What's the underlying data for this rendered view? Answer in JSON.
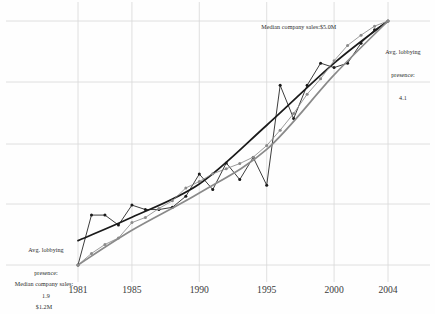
{
  "chart_data": {
    "type": "line",
    "title": "",
    "subtitle": "",
    "xlabel": "",
    "ylabel": "",
    "grid": true,
    "legend_position": "none",
    "xlim": [
      1981,
      2004
    ],
    "x_tick_labels": [
      "1981",
      "1985",
      "1990",
      "1995",
      "2000",
      "2004"
    ],
    "x_ticks": [
      1981,
      1985,
      1990,
      1995,
      2000,
      2004
    ],
    "y_axis_left": {
      "label": "Avg. lobbying presence",
      "start_value": 1.9,
      "end_value": 4.1
    },
    "y_axis_right": {
      "label": "Median company sales",
      "start_value": "$1.2M",
      "end_value": "$5.0M"
    },
    "series": [
      {
        "name": "Avg. lobbying presence",
        "color": "#1a1a1a",
        "marker": "circle",
        "x": [
          1981,
          1982,
          1983,
          1984,
          1985,
          1986,
          1987,
          1988,
          1989,
          1990,
          1991,
          1992,
          1993,
          1994,
          1995,
          1996,
          1997,
          1998,
          1999,
          2000,
          2001,
          2002,
          2003,
          2004
        ],
        "y": [
          1.9,
          2.35,
          2.35,
          2.26,
          2.44,
          2.4,
          2.4,
          2.42,
          2.52,
          2.72,
          2.58,
          2.82,
          2.67,
          2.87,
          2.62,
          3.52,
          3.22,
          3.52,
          3.72,
          3.68,
          3.72,
          3.9,
          4.02,
          4.1
        ]
      },
      {
        "name": "Avg. lobbying presence (trend)",
        "color": "#1a1a1a",
        "marker": "none",
        "trend": true,
        "x": [
          1981,
          1985,
          1990,
          1995,
          2000,
          2004
        ],
        "y": [
          2.12,
          2.33,
          2.63,
          3.16,
          3.72,
          4.1
        ]
      },
      {
        "name": "Median company sales",
        "color": "#8a8a8a",
        "marker": "circle",
        "x": [
          1981,
          1982,
          1983,
          1984,
          1985,
          1986,
          1987,
          1988,
          1989,
          1990,
          1991,
          1992,
          1993,
          1994,
          1995,
          1996,
          1997,
          1998,
          1999,
          2000,
          2001,
          2002,
          2003,
          2004
        ],
        "y": [
          1.2,
          1.38,
          1.52,
          1.62,
          1.86,
          1.94,
          2.08,
          2.2,
          2.4,
          2.5,
          2.62,
          2.7,
          2.78,
          2.88,
          3.06,
          3.3,
          3.56,
          3.86,
          4.1,
          4.38,
          4.62,
          4.78,
          4.92,
          5.0
        ]
      },
      {
        "name": "Median company sales (trend)",
        "color": "#8a8a8a",
        "marker": "none",
        "trend": true,
        "x": [
          1981,
          1985,
          1990,
          1995,
          2000,
          2004
        ],
        "y": [
          1.2,
          1.74,
          2.32,
          3.0,
          4.16,
          5.0
        ]
      }
    ],
    "annotations": [
      {
        "id": "median-sales-end",
        "text": "Median company sales:$5.0M",
        "position": "top-right"
      },
      {
        "id": "lobbying-end",
        "text": "Avg. lobbying\npresence:\n4.1",
        "position": "right"
      },
      {
        "id": "lobbying-start",
        "text": "Avg. lobbying\npresence:\n1.9",
        "position": "left"
      },
      {
        "id": "median-sales-start",
        "text": "Median company sales:\n$1.2M",
        "position": "bottom-left"
      }
    ]
  },
  "annotations": {
    "median_sales_end": "Median company sales:$5.0M",
    "lobbying_end_line1": "Avg. lobbying",
    "lobbying_end_line2": "presence:",
    "lobbying_end_line3": "4.1",
    "lobbying_start_line1": "Avg. lobbying",
    "lobbying_start_line2": "presence:",
    "lobbying_start_line3": "1.9",
    "median_sales_start_line1": "Median company sales:",
    "median_sales_start_line2": "$1.2M"
  },
  "axis": {
    "ticks": [
      {
        "label": "1981"
      },
      {
        "label": "1985"
      },
      {
        "label": "1990"
      },
      {
        "label": "1995"
      },
      {
        "label": "2000"
      },
      {
        "label": "2004"
      }
    ]
  },
  "colors": {
    "background": "#fefefe",
    "grid": "#d8d8d8",
    "series_dark": "#1a1a1a",
    "series_light": "#8a8a8a",
    "text": "#2b2b2b"
  }
}
